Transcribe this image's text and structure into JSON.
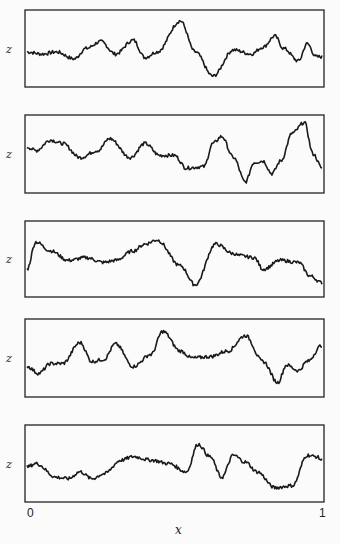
{
  "chart_data": {
    "type": "line",
    "title": "",
    "xlabel": "x",
    "ylabel": "z",
    "xlim": [
      0,
      1
    ],
    "x_ticks": [
      "0",
      "1"
    ],
    "grid": false,
    "legend": null,
    "panels": [
      {
        "name": "panel-1",
        "ylabel": "z",
        "x": [
          0,
          0.05,
          0.1,
          0.16,
          0.2,
          0.25,
          0.3,
          0.36,
          0.4,
          0.44,
          0.52,
          0.57,
          0.63,
          0.7,
          0.76,
          0.8,
          0.84,
          0.87,
          0.92,
          0.95,
          0.98,
          1
        ],
        "y": [
          0.45,
          0.42,
          0.45,
          0.35,
          0.5,
          0.6,
          0.42,
          0.62,
          0.37,
          0.45,
          0.9,
          0.45,
          0.1,
          0.48,
          0.42,
          0.52,
          0.68,
          0.5,
          0.32,
          0.57,
          0.38,
          0.38
        ]
      },
      {
        "name": "panel-2",
        "ylabel": "z",
        "x": [
          0,
          0.03,
          0.08,
          0.12,
          0.18,
          0.24,
          0.28,
          0.35,
          0.4,
          0.45,
          0.5,
          0.54,
          0.6,
          0.63,
          0.66,
          0.7,
          0.74,
          0.77,
          0.8,
          0.83,
          0.86,
          0.9,
          0.94,
          0.97,
          1
        ],
        "y": [
          0.6,
          0.55,
          0.7,
          0.65,
          0.45,
          0.55,
          0.72,
          0.45,
          0.65,
          0.48,
          0.48,
          0.3,
          0.32,
          0.65,
          0.75,
          0.45,
          0.1,
          0.38,
          0.4,
          0.22,
          0.4,
          0.8,
          0.95,
          0.5,
          0.3
        ]
      },
      {
        "name": "panel-3",
        "ylabel": "z",
        "x": [
          0,
          0.03,
          0.08,
          0.14,
          0.2,
          0.26,
          0.3,
          0.36,
          0.4,
          0.44,
          0.52,
          0.57,
          0.64,
          0.7,
          0.72,
          0.77,
          0.8,
          0.86,
          0.92,
          0.96,
          1
        ],
        "y": [
          0.35,
          0.75,
          0.62,
          0.48,
          0.52,
          0.45,
          0.48,
          0.62,
          0.72,
          0.78,
          0.4,
          0.12,
          0.72,
          0.58,
          0.55,
          0.52,
          0.35,
          0.48,
          0.45,
          0.25,
          0.15
        ]
      },
      {
        "name": "panel-4",
        "ylabel": "z",
        "x": [
          0,
          0.04,
          0.08,
          0.12,
          0.18,
          0.22,
          0.26,
          0.3,
          0.36,
          0.42,
          0.46,
          0.52,
          0.56,
          0.62,
          0.68,
          0.74,
          0.8,
          0.85,
          0.88,
          0.92,
          0.95,
          1
        ],
        "y": [
          0.38,
          0.28,
          0.42,
          0.42,
          0.72,
          0.45,
          0.48,
          0.7,
          0.38,
          0.55,
          0.88,
          0.6,
          0.5,
          0.52,
          0.6,
          0.82,
          0.45,
          0.15,
          0.4,
          0.32,
          0.45,
          0.68
        ]
      },
      {
        "name": "panel-5",
        "ylabel": "z",
        "x": [
          0,
          0.03,
          0.1,
          0.14,
          0.18,
          0.22,
          0.26,
          0.32,
          0.36,
          0.42,
          0.48,
          0.54,
          0.58,
          0.62,
          0.66,
          0.7,
          0.74,
          0.78,
          0.84,
          0.9,
          0.95,
          0.98,
          1
        ],
        "y": [
          0.45,
          0.5,
          0.3,
          0.28,
          0.38,
          0.28,
          0.35,
          0.55,
          0.6,
          0.55,
          0.5,
          0.38,
          0.78,
          0.6,
          0.3,
          0.62,
          0.52,
          0.38,
          0.15,
          0.18,
          0.62,
          0.6,
          0.55
        ]
      }
    ]
  }
}
